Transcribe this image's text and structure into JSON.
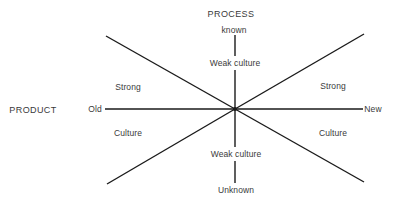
{
  "diagram": {
    "type": "radial-axes",
    "center": {
      "x": 235,
      "y": 109
    },
    "axes": {
      "process": {
        "title": "PROCESS",
        "top_label": "known",
        "bottom_label": "Unknown"
      },
      "product": {
        "title": "PRODUCT",
        "left_label": "Old",
        "right_label": "New"
      }
    },
    "regions": {
      "top": "Weak culture",
      "bottom": "Weak culture",
      "left_upper": "Strong",
      "left_lower": "Culture",
      "right_upper": "Strong",
      "right_lower": "Culture"
    },
    "lines": [
      {
        "name": "horizontal-axis",
        "x1": 105,
        "y1": 109,
        "x2": 363,
        "y2": 109
      },
      {
        "name": "vertical-axis-top-outer",
        "x1": 235,
        "y1": 35,
        "x2": 235,
        "y2": 56
      },
      {
        "name": "vertical-axis-top-inner",
        "x1": 235,
        "y1": 70,
        "x2": 235,
        "y2": 109
      },
      {
        "name": "vertical-axis-bottom-inner",
        "x1": 235,
        "y1": 109,
        "x2": 235,
        "y2": 147
      },
      {
        "name": "vertical-axis-bottom-outer",
        "x1": 235,
        "y1": 161,
        "x2": 235,
        "y2": 183
      },
      {
        "name": "diagonal-top-left",
        "x1": 106,
        "y1": 36,
        "x2": 235,
        "y2": 109
      },
      {
        "name": "diagonal-top-right",
        "x1": 235,
        "y1": 109,
        "x2": 364,
        "y2": 34
      },
      {
        "name": "diagonal-bottom-left",
        "x1": 107,
        "y1": 184,
        "x2": 235,
        "y2": 109
      },
      {
        "name": "diagonal-bottom-right",
        "x1": 235,
        "y1": 109,
        "x2": 364,
        "y2": 182
      }
    ],
    "colors": {
      "line": "#1a1a1a",
      "text": "#3a3a3a",
      "background": "#ffffff"
    }
  }
}
